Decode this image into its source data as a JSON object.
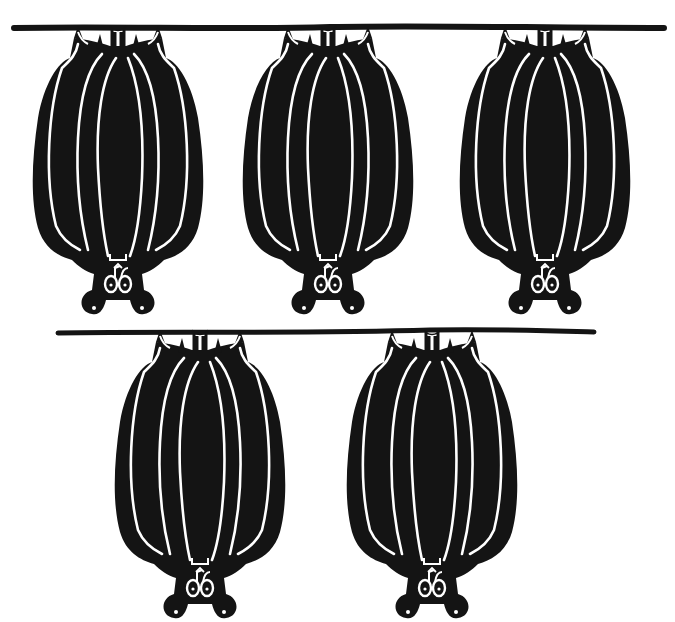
{
  "image": {
    "description": "Black and white clip-art of five bats hanging upside down from two branches",
    "background": "#ffffff",
    "ink": "#141414"
  },
  "branches": [
    {
      "id": "top-branch",
      "x1": 13,
      "x2": 665,
      "y": 28,
      "bats": 3
    },
    {
      "id": "bottom-branch",
      "x1": 57,
      "x2": 595,
      "y": 332,
      "bats": 2
    }
  ],
  "bats": [
    {
      "id": "bat-1",
      "x": 118,
      "y": 28
    },
    {
      "id": "bat-2",
      "x": 328,
      "y": 28
    },
    {
      "id": "bat-3",
      "x": 545,
      "y": 28
    },
    {
      "id": "bat-4",
      "x": 200,
      "y": 332
    },
    {
      "id": "bat-5",
      "x": 432,
      "y": 332
    }
  ]
}
